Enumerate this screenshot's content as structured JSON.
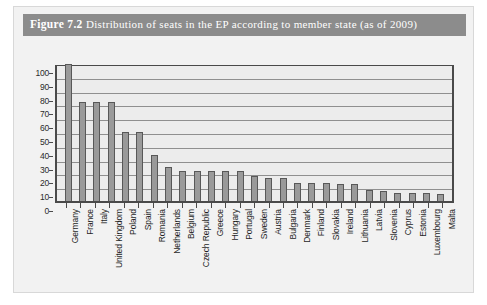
{
  "caption": {
    "label": "Figure 7.2",
    "text": "Distribution of seats in the EP according to member state (as of 2009)"
  },
  "colors": {
    "caption_bar": "#8c8c8c",
    "figure_background": "#f2f2f2",
    "plot_background": "#ececec",
    "bar_fill": "#9a9a9a",
    "bar_border": "#585858",
    "axis": "#4a4a4a",
    "gridline": "#8f8f8f"
  },
  "chart_data": {
    "type": "bar",
    "title": "Distribution of seats in the EP according to member state (as of 2009)",
    "xlabel": "",
    "ylabel": "",
    "ylim": [
      0,
      100
    ],
    "ytick_interval": 10,
    "ytick_labels": [
      "100",
      "90",
      "80",
      "70",
      "60",
      "50",
      "40",
      "30",
      "20",
      "10",
      "0"
    ],
    "grid": true,
    "legend": false,
    "categories": [
      "Germany",
      "France",
      "Italy",
      "United Kingdom",
      "Poland",
      "Spain",
      "Romania",
      "Netherlands",
      "Belgium",
      "Czech Republic",
      "Greece",
      "Hungary",
      "Portugal",
      "Sweden",
      "Austria",
      "Bulgaria",
      "Denmark",
      "Finland",
      "Slovakia",
      "Ireland",
      "Lithuania",
      "Latvia",
      "Slovenia",
      "Cyprus",
      "Estonia",
      "Luxembourg",
      "Malta"
    ],
    "values": [
      99,
      72,
      72,
      72,
      50,
      50,
      33,
      25,
      22,
      22,
      22,
      22,
      22,
      18,
      17,
      17,
      13,
      13,
      13,
      12,
      12,
      8,
      7,
      6,
      6,
      6,
      5
    ]
  }
}
